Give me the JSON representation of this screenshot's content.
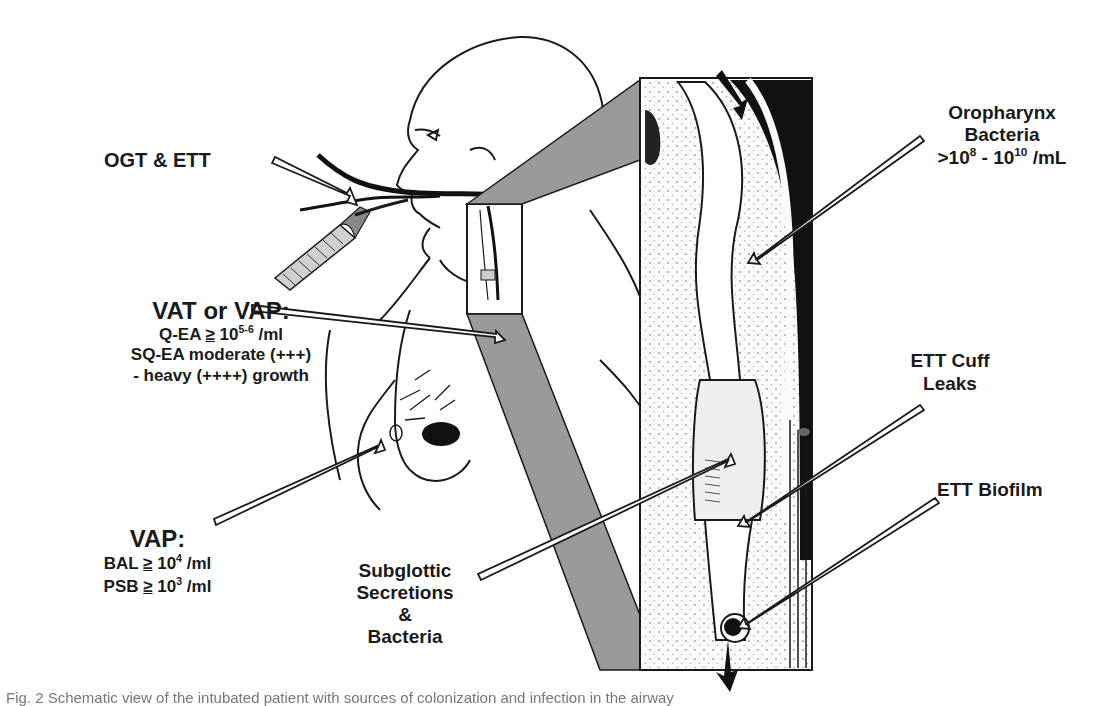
{
  "figure": {
    "type": "schematic diagram",
    "colors": {
      "line": "#1a1a1a",
      "inset_wedge": "#9a9a9a",
      "background": "#ffffff"
    }
  },
  "labels": {
    "ogt_ett": {
      "text": "OGT & ETT"
    },
    "vat_vap": {
      "title": "VAT or VAP:",
      "line1_prefix": "Q-EA ",
      "line1_ge": "≥",
      "line1_base": " 10",
      "line1_sup": "5-6",
      "line1_suffix": " /ml",
      "line2": "SQ-EA moderate (+++)",
      "line3": "- heavy (++++) growth"
    },
    "vap": {
      "title": "VAP:",
      "bal_prefix": "BAL ",
      "bal_ge": "≥",
      "bal_base": " 10",
      "bal_sup": "4",
      "bal_suffix": " /ml",
      "psb_prefix": "PSB ",
      "psb_ge": "≥",
      "psb_base": " 10",
      "psb_sup": "3",
      "psb_suffix": " /ml"
    },
    "subglottic": {
      "line1": "Subglottic",
      "line2": "Secretions",
      "line3": "&",
      "line4": "Bacteria"
    },
    "oropharynx": {
      "line1": "Oropharynx",
      "line2": "Bacteria",
      "line3_a": ">10",
      "line3_sup1": "8",
      "line3_b": " - 10",
      "line3_sup2": "10",
      "line3_c": " /mL"
    },
    "ett_cuff": {
      "line1": "ETT Cuff",
      "line2": "Leaks"
    },
    "ett_biofilm": {
      "text": "ETT Biofilm"
    }
  },
  "caption": {
    "text": "Fig. 2 Schematic view of the intubated patient with sources of colonization and infection in the airway"
  }
}
